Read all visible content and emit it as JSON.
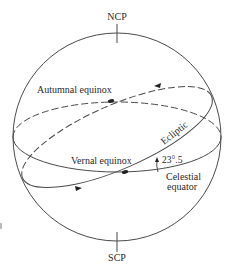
{
  "diagram": {
    "type": "celestial-sphere",
    "labels": {
      "north_pole": "NCP",
      "south_pole": "SCP",
      "autumnal_equinox": "Autumnal equinox",
      "vernal_equinox": "Vernal equinox",
      "ecliptic": "Ecliptic",
      "obliquity": "23°.5",
      "celestial_equator_line1": "Celestial",
      "celestial_equator_line2": "equator"
    },
    "colors": {
      "line": "#3a3a3a",
      "text": "#2a2a2a",
      "background": "#ffffff"
    }
  }
}
